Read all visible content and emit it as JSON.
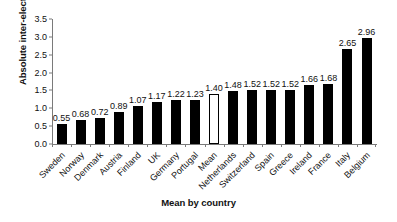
{
  "chart_data": {
    "type": "bar",
    "title": "",
    "xlabel": "Mean by country",
    "ylabel": "Absolute inter-election change",
    "ylim": [
      0,
      3.5
    ],
    "ytick_step": 0.5,
    "grid": false,
    "legend": "none",
    "label_rotation_deg": -45,
    "categories": [
      "Sweden",
      "Norway",
      "Denmark",
      "Austria",
      "Finland",
      "UK",
      "Germany",
      "Portugal",
      "Mean",
      "Netherlands",
      "Switzerland",
      "Spain",
      "Greece",
      "Ireland",
      "France",
      "Italy",
      "Belgium"
    ],
    "values": [
      0.55,
      0.68,
      0.72,
      0.89,
      1.07,
      1.17,
      1.22,
      1.23,
      1.4,
      1.48,
      1.52,
      1.52,
      1.52,
      1.66,
      1.68,
      2.65,
      2.96
    ],
    "value_labels": [
      "0.55",
      "0.68",
      "0.72",
      "0.89",
      "1.07",
      "1.17",
      "1.22",
      "1.23",
      "1.40",
      "1.48",
      "1.52",
      "1.52",
      "1.52",
      "1.66",
      "1.68",
      "2.65",
      "2.96"
    ],
    "bar_styles": [
      "filled",
      "filled",
      "filled",
      "filled",
      "filled",
      "filled",
      "filled",
      "filled",
      "hollow",
      "filled",
      "filled",
      "filled",
      "filled",
      "filled",
      "filled",
      "filled",
      "filled"
    ],
    "ytick_labels": [
      "0.0",
      "0.5",
      "1.0",
      "1.5",
      "2.0",
      "2.5",
      "3.0",
      "3.5"
    ],
    "ytick_values": [
      0.0,
      0.5,
      1.0,
      1.5,
      2.0,
      2.5,
      3.0,
      3.5
    ],
    "colors": {
      "bar_fill": "#000000",
      "bar_hollow_fill": "#ffffff",
      "bar_outline": "#000000",
      "axis": "#7a7a7a",
      "text": "#111111",
      "background": "#ffffff"
    }
  }
}
